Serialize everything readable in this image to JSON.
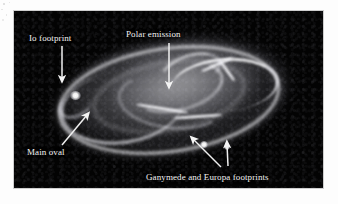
{
  "figure": {
    "kind": "astronomical-image",
    "background_color": "#030303",
    "annotation_color": "#f2f2f2",
    "annotations": [
      {
        "id": "io-footprint",
        "label": "Io footprint",
        "arrow": "down",
        "label_x": 29,
        "label_y": 33,
        "arrow_from": [
          62,
          46
        ],
        "arrow_to": [
          62,
          80
        ]
      },
      {
        "id": "polar-emission",
        "label": "Polar emission",
        "arrow": "down",
        "label_x": 126,
        "label_y": 29,
        "arrow_from": [
          169,
          43
        ],
        "arrow_to": [
          169,
          86
        ]
      },
      {
        "id": "main-oval",
        "label": "Main oval",
        "arrow": "up-right",
        "label_x": 27,
        "label_y": 147,
        "arrow_from": [
          62,
          145
        ],
        "arrow_to": [
          88,
          114
        ]
      },
      {
        "id": "ganymede-europa-footprints",
        "label": "Ganymede and Europa footprints",
        "arrow": "up-left-and-up",
        "label_x": 146,
        "label_y": 172,
        "arrow_from": [
          221,
          167
        ],
        "arrow_to": [
          192,
          138
        ],
        "arrow2_from": [
          228,
          166
        ],
        "arrow2_to": [
          227,
          143
        ]
      }
    ],
    "features": [
      {
        "name": "Io footprint spot",
        "x": 61,
        "y": 84
      },
      {
        "name": "Ganymede footprint spot",
        "x": 190,
        "y": 133
      },
      {
        "name": "Europa footprint spot",
        "x": 213,
        "y": 136
      }
    ]
  }
}
